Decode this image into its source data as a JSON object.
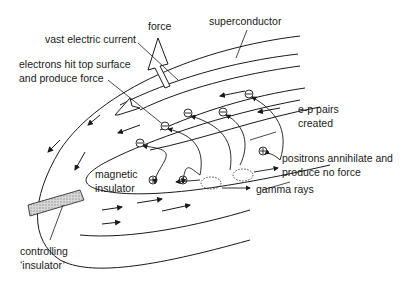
{
  "diagram": {
    "colors": {
      "ink": "#1a1a1a",
      "background": "#ffffff",
      "insulator_fill": "#c8c8c8"
    },
    "labels": {
      "force": "force",
      "superconductor": "superconductor",
      "vast_electric_current": "vast electric current",
      "electrons_line1": "electrons hit top surface",
      "electrons_line2": "and produce force",
      "ep_pairs_line1": "e-p pairs",
      "ep_pairs_line2": "created",
      "magnetic_line1": "magnetic",
      "magnetic_line2": "insulator",
      "positrons_line1": "positrons annihilate and",
      "positrons_line2": "produce no force",
      "gamma_rays": "gamma rays",
      "controlling_line1": "controlling",
      "controlling_line2": "‘insulator’"
    },
    "particle_symbols": {
      "electron": "−",
      "positron": "+"
    }
  }
}
